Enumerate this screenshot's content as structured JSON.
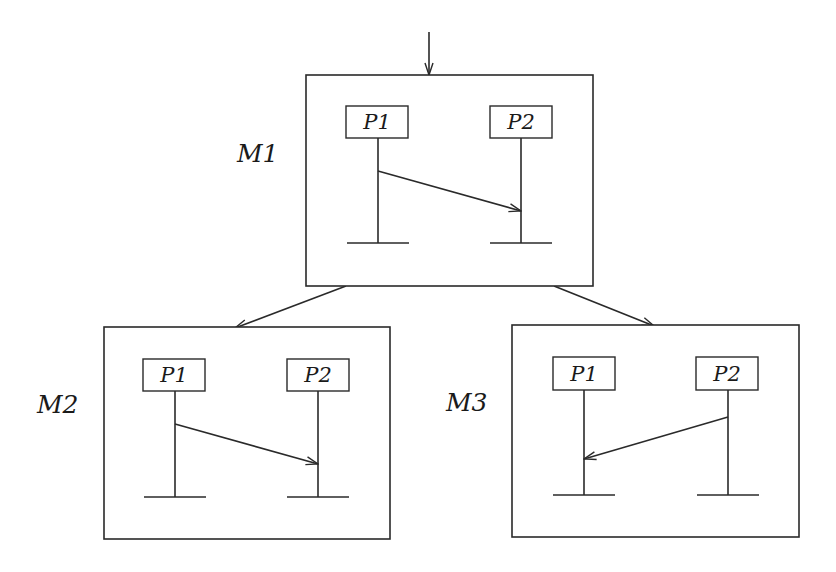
{
  "diagram": {
    "type": "message-sequence-chart-tree",
    "colors": {
      "stroke": "#2a2a2a",
      "background": "#ffffff",
      "text": "#1a1a1a"
    },
    "entry_arrow": {
      "x": 429,
      "y1": 32,
      "y2": 75
    },
    "charts": [
      {
        "id": "M1",
        "label": "M1",
        "label_pos": {
          "x": 237,
          "y": 162
        },
        "frame": {
          "x": 306,
          "y": 75,
          "w": 287,
          "h": 211
        },
        "processes": [
          {
            "name": "P1",
            "box": {
              "x": 346,
              "y": 106,
              "w": 62,
              "h": 32
            },
            "lifeline_x": 378,
            "lifeline_end": 243
          },
          {
            "name": "P2",
            "box": {
              "x": 490,
              "y": 106,
              "w": 62,
              "h": 32
            },
            "lifeline_x": 521,
            "lifeline_end": 243
          }
        ],
        "messages": [
          {
            "from": "P1",
            "to": "P2",
            "x1": 378,
            "y1": 171,
            "x2": 521,
            "y2": 211
          }
        ]
      },
      {
        "id": "M2",
        "label": "M2",
        "label_pos": {
          "x": 37,
          "y": 413
        },
        "frame": {
          "x": 104,
          "y": 327,
          "w": 286,
          "h": 212
        },
        "processes": [
          {
            "name": "P1",
            "box": {
              "x": 143,
              "y": 359,
              "w": 62,
              "h": 32
            },
            "lifeline_x": 175,
            "lifeline_end": 497
          },
          {
            "name": "P2",
            "box": {
              "x": 287,
              "y": 359,
              "w": 62,
              "h": 32
            },
            "lifeline_x": 318,
            "lifeline_end": 497
          }
        ],
        "messages": [
          {
            "from": "P1",
            "to": "P2",
            "x1": 175,
            "y1": 424,
            "x2": 318,
            "y2": 464
          }
        ]
      },
      {
        "id": "M3",
        "label": "M3",
        "label_pos": {
          "x": 446,
          "y": 411
        },
        "frame": {
          "x": 512,
          "y": 325,
          "w": 287,
          "h": 212
        },
        "processes": [
          {
            "name": "P1",
            "box": {
              "x": 553,
              "y": 357,
              "w": 62,
              "h": 33
            },
            "lifeline_x": 584,
            "lifeline_end": 495
          },
          {
            "name": "P2",
            "box": {
              "x": 696,
              "y": 357,
              "w": 62,
              "h": 33
            },
            "lifeline_x": 728,
            "lifeline_end": 495
          }
        ],
        "messages": [
          {
            "from": "P2",
            "to": "P1",
            "x1": 728,
            "y1": 417,
            "x2": 584,
            "y2": 459
          }
        ]
      }
    ],
    "transitions": [
      {
        "from": "M1",
        "to": "M2",
        "x1": 346,
        "y1": 286,
        "x2": 235,
        "y2": 328
      },
      {
        "from": "M1",
        "to": "M3",
        "x1": 554,
        "y1": 286,
        "x2": 654,
        "y2": 326
      }
    ]
  }
}
